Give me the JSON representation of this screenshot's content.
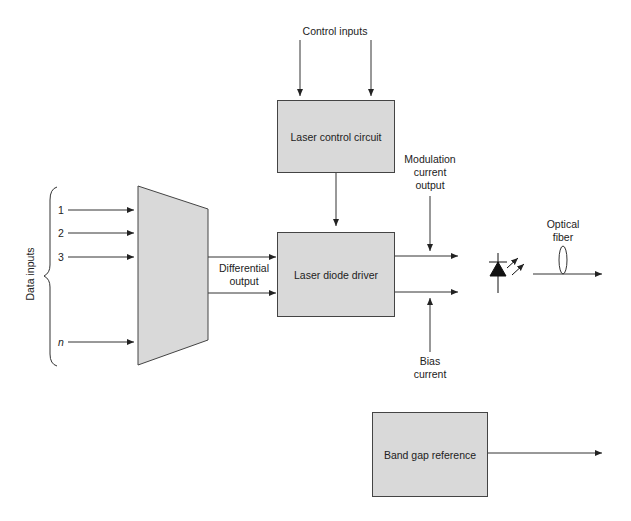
{
  "diagram": {
    "type": "block-diagram",
    "blocks": {
      "multiplexer": "Multiplexer",
      "laser_control_circuit": "Laser control circuit",
      "laser_diode_driver": "Laser diode driver",
      "laser_diode": "Laser diode",
      "band_gap_reference": "Band gap reference"
    },
    "labels": {
      "data_inputs": "Data inputs",
      "control_inputs": "Control inputs",
      "differential_output_1": "Differential",
      "differential_output_2": "output",
      "modulation_1": "Modulation",
      "modulation_2": "current",
      "modulation_3": "output",
      "bias_1": "Bias",
      "bias_2": "current",
      "optical_1": "Optical",
      "optical_2": "fiber"
    },
    "data_input_items": [
      "1",
      "2",
      "3",
      "n"
    ],
    "connections": [
      {
        "from": "data inputs 1..n",
        "to": "Multiplexer"
      },
      {
        "from": "Multiplexer",
        "to": "Laser diode driver",
        "label": "Differential output"
      },
      {
        "from": "Control inputs",
        "to": "Laser control circuit"
      },
      {
        "from": "Laser control circuit",
        "to": "Laser diode driver"
      },
      {
        "from": "Laser diode driver",
        "to": "Laser diode",
        "label": "Modulation current output"
      },
      {
        "from": "Laser diode driver",
        "to": "Laser diode",
        "label": "Bias current"
      },
      {
        "from": "Laser diode",
        "to": "output",
        "label": "Optical fiber"
      },
      {
        "from": "Band gap reference",
        "to": "output"
      }
    ],
    "colors": {
      "block_fill": "#d9d9d9",
      "stroke": "#333333"
    }
  }
}
